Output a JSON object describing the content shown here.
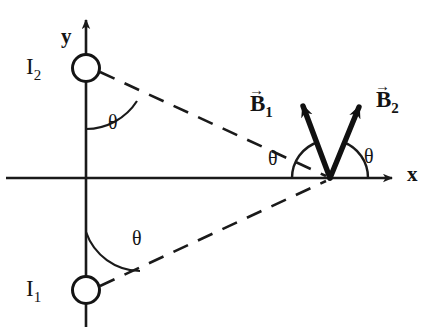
{
  "figure": {
    "type": "physics-vector-diagram",
    "axes": {
      "x_label": "x",
      "y_label": "y",
      "origin_px": [
        86,
        178
      ]
    },
    "wires": [
      {
        "id": "I1",
        "label": "I",
        "subscript": "1",
        "position_px": [
          86,
          290
        ],
        "marker": "circle"
      },
      {
        "id": "I2",
        "label": "I",
        "subscript": "2",
        "position_px": [
          86,
          68
        ],
        "marker": "circle"
      }
    ],
    "field_point_px": [
      330,
      178
    ],
    "vectors": [
      {
        "id": "B1",
        "label": "B",
        "subscript": "1",
        "overset": "arrow",
        "tail_px": [
          330,
          178
        ],
        "tip_px": [
          299,
          94
        ],
        "label_px": [
          252,
          96
        ]
      },
      {
        "id": "B2",
        "label": "B",
        "subscript": "2",
        "overset": "arrow",
        "tail_px": [
          330,
          178
        ],
        "tip_px": [
          363,
          95
        ],
        "label_px": [
          376,
          92
        ]
      }
    ],
    "dashed_lines": [
      {
        "from": "I2",
        "to": "field_point",
        "from_px": [
          86,
          68
        ],
        "to_px": [
          330,
          178
        ]
      },
      {
        "from": "I1",
        "to": "field_point",
        "from_px": [
          86,
          290
        ],
        "to_px": [
          330,
          178
        ]
      }
    ],
    "angles": [
      {
        "name": "theta-at-I2",
        "symbol": "θ",
        "label_px": [
          112,
          112
        ]
      },
      {
        "name": "theta-at-I1",
        "symbol": "θ",
        "label_px": [
          136,
          228
        ]
      },
      {
        "name": "theta-B1-at-point",
        "symbol": "θ",
        "label_px": [
          271,
          148
        ]
      },
      {
        "name": "theta-B2-at-point",
        "symbol": "θ",
        "label_px": [
          366,
          146
        ]
      }
    ],
    "colors": {
      "ink": "#141414",
      "background": "#ffffff",
      "vector_stroke": "#111111",
      "axis_stroke": "#1a1a1a",
      "dash_stroke": "#1a1a1a"
    }
  }
}
